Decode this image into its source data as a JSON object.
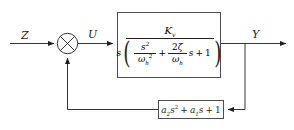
{
  "diagram": {
    "type": "control-block-diagram",
    "signals": {
      "input": "Z",
      "error": "U",
      "output": "Y"
    },
    "summing_junction": {
      "style": "crossed-circle",
      "inputs": [
        "Z",
        "feedback"
      ],
      "output": "U",
      "signs": [
        "",
        ""
      ]
    },
    "forward_block": {
      "numerator": {
        "symbol": "K",
        "subscript": "v"
      },
      "denominator": {
        "leading_factor": "s",
        "term1": {
          "numerator_symbol": "s",
          "numerator_exponent": "2",
          "denominator_symbol": "ω",
          "denominator_subscript": "h",
          "denominator_exponent": "2"
        },
        "operator": "+",
        "term2": {
          "numerator_coefficient": "2",
          "numerator_symbol": "ζ",
          "denominator_symbol": "ω",
          "denominator_subscript": "h"
        },
        "term2_variable": "s",
        "trailing_operator": "+",
        "constant": "1"
      },
      "plain_text": "Kv / [ s ( s²/ωh² + (2ζ/ωh) s + 1 ) ]"
    },
    "feedback_block": {
      "coeff2": "a",
      "coeff2_sub": "2",
      "var": "s",
      "exp2": "2",
      "operator1": "+",
      "coeff1": "a",
      "coeff1_sub": "1",
      "operator2": "+",
      "constant": "1",
      "plain_text": "a₂s² + a₁s + 1"
    },
    "colors": {
      "line": "#231f20",
      "block_border": "#4d4d4f",
      "background": "#ffffff"
    }
  }
}
